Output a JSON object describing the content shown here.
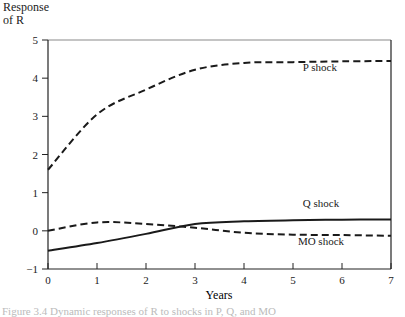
{
  "chart_data": {
    "type": "line",
    "title": "",
    "ylabel": "Response of R",
    "ylabel_lines": [
      "Response",
      "of R"
    ],
    "xlabel": "Years",
    "x": [
      0,
      1,
      2,
      3,
      4,
      5,
      6,
      7
    ],
    "xlim": [
      0,
      7
    ],
    "ylim": [
      -1,
      5
    ],
    "xticks": [
      "0",
      "1",
      "2",
      "3",
      "4",
      "5",
      "6",
      "7"
    ],
    "yticks": [
      "5",
      "4",
      "3",
      "2",
      "1",
      "0",
      "−1"
    ],
    "grid": false,
    "series": [
      {
        "name": "P shock",
        "style": "dashed",
        "values": [
          1.6,
          3.05,
          3.7,
          4.22,
          4.4,
          4.42,
          4.44,
          4.45
        ]
      },
      {
        "name": "Q shock",
        "style": "solid",
        "values": [
          -0.52,
          -0.32,
          -0.08,
          0.18,
          0.25,
          0.28,
          0.29,
          0.3
        ]
      },
      {
        "name": "MO shock",
        "style": "dashed",
        "values": [
          0.0,
          0.22,
          0.18,
          0.08,
          -0.05,
          -0.1,
          -0.11,
          -0.13
        ]
      }
    ],
    "annotations": [
      {
        "text": "P shock",
        "x": 5.2,
        "y": 4.18
      },
      {
        "text": "Q shock",
        "x": 5.2,
        "y": 0.62
      },
      {
        "text": "MO shock",
        "x": 5.1,
        "y": -0.38
      }
    ]
  },
  "caption": "Figure 3.4  Dynamic responses of R to shocks in P, Q, and MO"
}
